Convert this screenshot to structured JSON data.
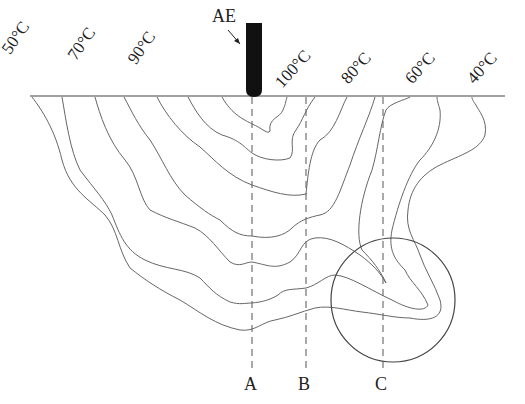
{
  "figure": {
    "type": "weld temperature field cross-section diagram",
    "electrode_label": "AE",
    "temperature_labels_left": [
      "50°C",
      "70°C",
      "90°C"
    ],
    "temperature_labels_right": [
      "100°C",
      "80°C",
      "60°C",
      "40°C"
    ],
    "section_lines": [
      "A",
      "B",
      "C"
    ],
    "highlight": "circled region near line C",
    "colors": {
      "line": "#555555",
      "electrode": "#111111",
      "background": "#ffffff"
    }
  }
}
